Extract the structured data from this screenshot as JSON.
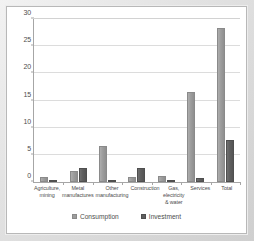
{
  "chart_data": {
    "type": "bar",
    "title": "",
    "subtitle": "",
    "xlabel": "",
    "ylabel": "",
    "ylim": [
      0,
      30
    ],
    "yticks": [
      0,
      5,
      10,
      15,
      20,
      25,
      30
    ],
    "ytick_labels": [
      "0",
      "5",
      "10",
      "15",
      "20",
      "25",
      "30"
    ],
    "grid": true,
    "legend_position": "bottom-center",
    "categories": [
      "Agriculture, mining",
      "Metal manufactures",
      "Other manufacturing",
      "Construction",
      "Gas, electricity & water",
      "Services",
      "Total"
    ],
    "series": [
      {
        "name": "Consumption",
        "color": "#9d9d9d",
        "values": [
          0.9,
          2.0,
          6.7,
          0.9,
          1.1,
          16.5,
          28.3
        ]
      },
      {
        "name": "Investment",
        "color": "#5f5f5f",
        "values": [
          0.05,
          2.6,
          0.3,
          2.6,
          0.2,
          0.7,
          7.7
        ]
      }
    ]
  },
  "legend": {
    "entries": [
      {
        "label": "Consumption",
        "swatch": "consumption-swatch"
      },
      {
        "label": "Investment",
        "swatch": "investment-swatch"
      }
    ]
  },
  "colors": {
    "consumption": "#9d9d9d",
    "investment": "#5f5f5f",
    "gridline": "#dcdcdc",
    "axis": "#a6a6a6",
    "text": "#4d4d4d",
    "frame": "#cfcfcf",
    "plot_background": "#ffffff"
  }
}
